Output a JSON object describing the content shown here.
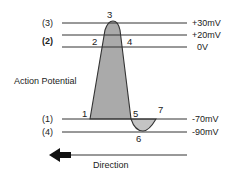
{
  "diagram": {
    "title": "Action Potential",
    "direction_label": "Direction",
    "levels": [
      {
        "left": "(3)",
        "right": "+30mV",
        "y": 23
      },
      {
        "left": "(2)",
        "right": "+20mV",
        "y": 35
      },
      {
        "left": "",
        "right": "0V",
        "y": 47
      },
      {
        "left": "(1)",
        "right": "-70mV",
        "y": 119
      },
      {
        "left": "(4)",
        "right": "-90mV",
        "y": 132
      }
    ],
    "points": [
      {
        "label": "1",
        "x": 87,
        "y": 116
      },
      {
        "label": "2",
        "x": 96,
        "y": 45
      },
      {
        "label": "3",
        "x": 110,
        "y": 17
      },
      {
        "label": "4",
        "x": 126,
        "y": 45
      },
      {
        "label": "5",
        "x": 135,
        "y": 116
      },
      {
        "label": "6",
        "x": 140,
        "y": 142
      },
      {
        "label": "7",
        "x": 157,
        "y": 116
      }
    ],
    "colors": {
      "line": "#333333",
      "fill": "#aaaaaa",
      "undershoot_fill": "#c4c4c4"
    }
  }
}
